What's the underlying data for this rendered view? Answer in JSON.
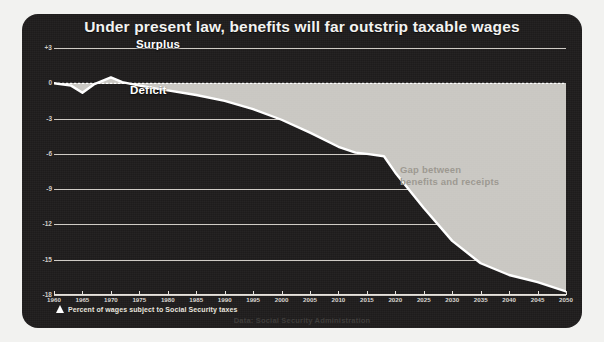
{
  "title": "Under present law, benefits will far outstrip taxable wages",
  "footnote": "Percent of wages subject to Social Security taxes",
  "footnote_marker_icon": "up-triangle-icon",
  "source": "Data: Social Security Administration",
  "annotations": {
    "surplus": "Surplus",
    "deficit": "Deficit",
    "gap_line1": "Gap between",
    "gap_line2": "benefits and receipts"
  },
  "colors": {
    "panel_background": "#1e1c1c",
    "page_background": "#f2f2f0",
    "gridline": "#dedad4",
    "series_line": "#ffffff",
    "gap_fill": "#c9c7c2",
    "title_text": "#f3f3f1",
    "gap_note_text": "#9c9890",
    "source_text": "#3c3a38"
  },
  "chart_data": {
    "type": "area",
    "title": "Under present law, benefits will far outstrip taxable wages",
    "subtitle": "",
    "xlabel": "",
    "ylabel": "Percent of wages subject to Social Security taxes",
    "xlim": [
      1960,
      2050
    ],
    "ylim": [
      -18,
      3
    ],
    "grid": true,
    "legend_position": "none",
    "yticks": [
      3,
      0,
      -3,
      -6,
      -9,
      -12,
      -15,
      -18
    ],
    "ytick_labels": [
      "+3",
      "0",
      "-3",
      "-6",
      "-9",
      "-12",
      "-15",
      "-18"
    ],
    "xticks": [
      1960,
      1965,
      1970,
      1975,
      1980,
      1985,
      1990,
      1995,
      2000,
      2005,
      2010,
      2015,
      2020,
      2025,
      2030,
      2035,
      2040,
      2045,
      2050
    ],
    "xtick_labels": [
      "1960",
      "1965",
      "1970",
      "1975",
      "1980",
      "1985",
      "1990",
      "1995",
      "2000",
      "2005",
      "2010",
      "2015",
      "2020",
      "2025",
      "2030",
      "2035",
      "2040",
      "2045",
      "2050"
    ],
    "baseline": 0,
    "series": [
      {
        "name": "Balance (taxable wages minus benefits)",
        "x": [
          1960,
          1963,
          1965,
          1967,
          1970,
          1972,
          1975,
          1980,
          1985,
          1990,
          1995,
          2000,
          2005,
          2010,
          2013,
          2015,
          2018,
          2020,
          2025,
          2030,
          2035,
          2040,
          2045,
          2050
        ],
        "values": [
          0.0,
          -0.2,
          -0.8,
          -0.1,
          0.5,
          0.1,
          -0.2,
          -0.6,
          -1.0,
          -1.5,
          -2.2,
          -3.1,
          -4.2,
          -5.4,
          -5.9,
          -6.0,
          -6.2,
          -7.6,
          -10.6,
          -13.4,
          -15.3,
          -16.3,
          -16.9,
          -17.7
        ]
      }
    ],
    "fill_region": {
      "label": "Gap between benefits and receipts",
      "from_baseline": 0,
      "to_series": "Balance (taxable wages minus benefits)"
    }
  }
}
